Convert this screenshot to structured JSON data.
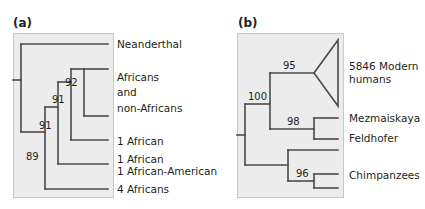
{
  "panels": [
    {
      "id": "a",
      "label": "(a)",
      "tips": {
        "neanderthal": "Neanderthal",
        "africans_non_africans": [
          "Africans",
          "and",
          "non-Africans"
        ],
        "one_african": "1 African",
        "one_african_am": [
          "1 African",
          "1 African-American"
        ],
        "four_africans": "4 Africans"
      },
      "bootstrap": {
        "n92": "92",
        "n91_upper": "91",
        "n91_lower": "91",
        "n89": "89"
      }
    },
    {
      "id": "b",
      "label": "(b)",
      "tips": {
        "modern_humans": [
          "5846 Modern",
          "humans"
        ],
        "mezmaiskaya": "Mezmaiskaya",
        "feldhofer": "Feldhofer",
        "chimpanzees": "Chimpanzees"
      },
      "bootstrap": {
        "n95": "95",
        "n100": "100",
        "n98": "98",
        "n96": "96"
      }
    }
  ]
}
